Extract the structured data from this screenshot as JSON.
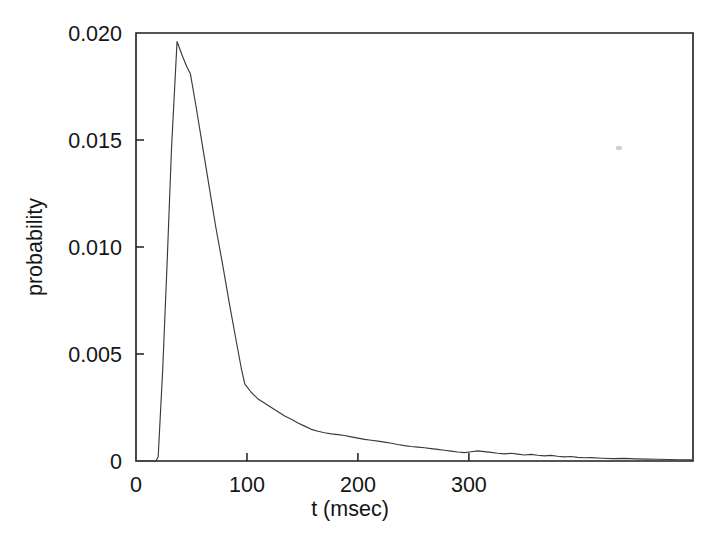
{
  "chart_data": {
    "type": "line",
    "title": "",
    "xlabel": "t (msec)",
    "ylabel": "probability",
    "xlim": [
      0,
      502
    ],
    "ylim": [
      0,
      0.02
    ],
    "grid": false,
    "legend": null,
    "xticks": [
      0,
      100,
      200,
      300
    ],
    "xtick_labels": [
      "0",
      "100",
      "200",
      "300"
    ],
    "yticks": [
      0,
      0.005,
      0.01,
      0.015,
      0.02
    ],
    "ytick_labels": [
      "0",
      "0.005",
      "0.010",
      "0.015",
      "0.020"
    ],
    "series": [
      {
        "name": "probability",
        "color": "#3a3a3a",
        "x": [
          0,
          8,
          14,
          18,
          20,
          24,
          28,
          32,
          37,
          42,
          46,
          49,
          54,
          60,
          66,
          72,
          78,
          84,
          90,
          95,
          98,
          104,
          110,
          116,
          122,
          128,
          134,
          140,
          146,
          152,
          158,
          164,
          170,
          176,
          182,
          188,
          194,
          200,
          206,
          212,
          218,
          224,
          230,
          236,
          242,
          248,
          254,
          260,
          266,
          272,
          278,
          284,
          290,
          296,
          302,
          308,
          314,
          320,
          326,
          332,
          338,
          344,
          350,
          356,
          362,
          368,
          374,
          380,
          386,
          392,
          398,
          404,
          410,
          420,
          430,
          440,
          450,
          460,
          470,
          480,
          490,
          500
        ],
        "y": [
          0.0,
          0.0,
          0.0,
          0.0,
          0.0002,
          0.0042,
          0.0092,
          0.0146,
          0.0196,
          0.0189,
          0.0184,
          0.0181,
          0.0166,
          0.0147,
          0.0128,
          0.0109,
          0.0092,
          0.0074,
          0.0057,
          0.0043,
          0.0036,
          0.0032,
          0.0029,
          0.0027,
          0.0025,
          0.0023,
          0.0021,
          0.00195,
          0.00178,
          0.00163,
          0.00148,
          0.00139,
          0.00132,
          0.00127,
          0.00123,
          0.00119,
          0.00113,
          0.00107,
          0.00101,
          0.00097,
          0.00093,
          0.00088,
          0.00083,
          0.00077,
          0.00072,
          0.00068,
          0.00065,
          0.00062,
          0.00058,
          0.00054,
          0.0005,
          0.00046,
          0.00042,
          0.00039,
          0.00043,
          0.00047,
          0.00044,
          0.0004,
          0.00036,
          0.00033,
          0.00036,
          0.00032,
          0.00028,
          0.00031,
          0.00027,
          0.00024,
          0.00026,
          0.00022,
          0.00019,
          0.00021,
          0.00017,
          0.00015,
          0.00016,
          0.00013,
          0.00011,
          0.00012,
          0.0001,
          9e-05,
          8e-05,
          7e-05,
          6e-05,
          5e-05
        ]
      }
    ]
  },
  "axes": {
    "y_title": "probability",
    "x_title": "t (msec)"
  }
}
